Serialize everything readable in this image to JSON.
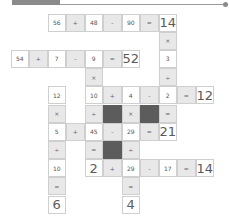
{
  "header": {
    "tab_color": "#8a8a8a",
    "line_color": "#9a9a9a"
  },
  "colors": {
    "number_bg": "#ffffff",
    "operator_bg": "#e8e8e8",
    "blocked_bg": "#5c5c5c",
    "border": "#cfcfcf",
    "text": "#555555"
  },
  "grid": {
    "cols": 11,
    "rows": 11,
    "cells": [
      {
        "r": 0,
        "c": 2,
        "t": "num",
        "v": "56"
      },
      {
        "r": 0,
        "c": 3,
        "t": "op",
        "v": "+"
      },
      {
        "r": 0,
        "c": 4,
        "t": "num",
        "v": "48"
      },
      {
        "r": 0,
        "c": 5,
        "t": "op",
        "v": "-"
      },
      {
        "r": 0,
        "c": 6,
        "t": "num",
        "v": "90"
      },
      {
        "r": 0,
        "c": 7,
        "t": "op",
        "v": "="
      },
      {
        "r": 0,
        "c": 8,
        "t": "result",
        "v": "14"
      },
      {
        "r": 1,
        "c": 8,
        "t": "op",
        "v": "×"
      },
      {
        "r": 2,
        "c": 0,
        "t": "num",
        "v": "54"
      },
      {
        "r": 2,
        "c": 1,
        "t": "op",
        "v": "+"
      },
      {
        "r": 2,
        "c": 2,
        "t": "num",
        "v": "7"
      },
      {
        "r": 2,
        "c": 3,
        "t": "op",
        "v": "-"
      },
      {
        "r": 2,
        "c": 4,
        "t": "num",
        "v": "9"
      },
      {
        "r": 2,
        "c": 5,
        "t": "op",
        "v": "="
      },
      {
        "r": 2,
        "c": 6,
        "t": "result",
        "v": "52"
      },
      {
        "r": 2,
        "c": 8,
        "t": "num",
        "v": "3"
      },
      {
        "r": 3,
        "c": 4,
        "t": "op",
        "v": "×"
      },
      {
        "r": 3,
        "c": 8,
        "t": "op",
        "v": "÷"
      },
      {
        "r": 4,
        "c": 2,
        "t": "num",
        "v": "12"
      },
      {
        "r": 4,
        "c": 4,
        "t": "num",
        "v": "10"
      },
      {
        "r": 4,
        "c": 5,
        "t": "op",
        "v": "+"
      },
      {
        "r": 4,
        "c": 6,
        "t": "num",
        "v": "4"
      },
      {
        "r": 4,
        "c": 7,
        "t": "op",
        "v": "-"
      },
      {
        "r": 4,
        "c": 8,
        "t": "num",
        "v": "2"
      },
      {
        "r": 4,
        "c": 9,
        "t": "op",
        "v": "="
      },
      {
        "r": 4,
        "c": 10,
        "t": "result",
        "v": "12"
      },
      {
        "r": 5,
        "c": 2,
        "t": "op",
        "v": "×"
      },
      {
        "r": 5,
        "c": 4,
        "t": "op",
        "v": "÷"
      },
      {
        "r": 5,
        "c": 5,
        "t": "dark",
        "v": ""
      },
      {
        "r": 5,
        "c": 6,
        "t": "op",
        "v": "×"
      },
      {
        "r": 5,
        "c": 7,
        "t": "dark",
        "v": ""
      },
      {
        "r": 5,
        "c": 8,
        "t": "op",
        "v": "="
      },
      {
        "r": 6,
        "c": 2,
        "t": "num",
        "v": "5"
      },
      {
        "r": 6,
        "c": 3,
        "t": "op",
        "v": "+"
      },
      {
        "r": 6,
        "c": 4,
        "t": "num",
        "v": "45"
      },
      {
        "r": 6,
        "c": 5,
        "t": "op",
        "v": "-"
      },
      {
        "r": 6,
        "c": 6,
        "t": "num",
        "v": "29"
      },
      {
        "r": 6,
        "c": 7,
        "t": "op",
        "v": "="
      },
      {
        "r": 6,
        "c": 8,
        "t": "result",
        "v": "21"
      },
      {
        "r": 7,
        "c": 2,
        "t": "op",
        "v": "÷"
      },
      {
        "r": 7,
        "c": 4,
        "t": "op",
        "v": "="
      },
      {
        "r": 7,
        "c": 5,
        "t": "dark",
        "v": ""
      },
      {
        "r": 7,
        "c": 6,
        "t": "op",
        "v": "÷"
      },
      {
        "r": 8,
        "c": 2,
        "t": "num",
        "v": "10"
      },
      {
        "r": 8,
        "c": 4,
        "t": "result",
        "v": "2"
      },
      {
        "r": 8,
        "c": 5,
        "t": "op",
        "v": "+"
      },
      {
        "r": 8,
        "c": 6,
        "t": "num",
        "v": "29"
      },
      {
        "r": 8,
        "c": 7,
        "t": "op",
        "v": "-"
      },
      {
        "r": 8,
        "c": 8,
        "t": "num",
        "v": "17"
      },
      {
        "r": 8,
        "c": 9,
        "t": "op",
        "v": "="
      },
      {
        "r": 8,
        "c": 10,
        "t": "result",
        "v": "14"
      },
      {
        "r": 9,
        "c": 2,
        "t": "op",
        "v": "="
      },
      {
        "r": 9,
        "c": 6,
        "t": "op",
        "v": "="
      },
      {
        "r": 10,
        "c": 2,
        "t": "result",
        "v": "6"
      },
      {
        "r": 10,
        "c": 6,
        "t": "result",
        "v": "4"
      }
    ]
  }
}
